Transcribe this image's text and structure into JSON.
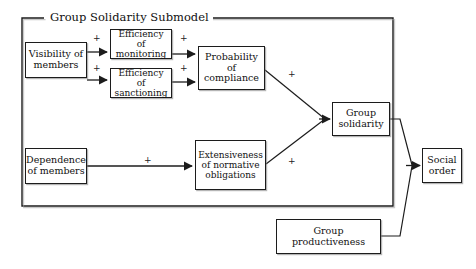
{
  "diagram": {
    "title": "Group Solidarity Submodel",
    "type": "causal-path-diagram",
    "frame": {
      "label": "Group Solidarity Submodel",
      "x": 22,
      "y": 18,
      "width": 371,
      "height": 188
    },
    "nodes": [
      {
        "id": "visibility",
        "label": "Visibility of\nmembers",
        "x": 25,
        "y": 42,
        "width": 62,
        "height": 36,
        "font_size": 9.5
      },
      {
        "id": "efficiency-monitoring",
        "label": "Efficiency of\nmonitoring",
        "x": 110,
        "y": 29,
        "width": 62,
        "height": 30,
        "font_size": 9
      },
      {
        "id": "efficiency-sanctioning",
        "label": "Efficiency of\nsanctioning",
        "x": 110,
        "y": 68,
        "width": 62,
        "height": 30,
        "font_size": 9
      },
      {
        "id": "probability-compliance",
        "label": "Probability of\ncompliance",
        "x": 198,
        "y": 46,
        "width": 67,
        "height": 44,
        "font_size": 9.5
      },
      {
        "id": "dependence",
        "label": "Dependence\nof members",
        "x": 25,
        "y": 148,
        "width": 62,
        "height": 36,
        "font_size": 9.5
      },
      {
        "id": "extensiveness",
        "label": "Extensiveness\nof normative\nobligations",
        "x": 195,
        "y": 140,
        "width": 71,
        "height": 50,
        "font_size": 9
      },
      {
        "id": "group-solidarity",
        "label": "Group\nsolidarity",
        "x": 332,
        "y": 102,
        "width": 58,
        "height": 34,
        "font_size": 9.5
      },
      {
        "id": "group-productiveness",
        "label": "Group\nproductiveness",
        "x": 276,
        "y": 219,
        "width": 105,
        "height": 35,
        "font_size": 9.5
      },
      {
        "id": "social-order",
        "label": "Social\norder",
        "x": 422,
        "y": 148,
        "width": 40,
        "height": 35,
        "font_size": 9.5
      }
    ],
    "signs": [
      {
        "id": "sign-vis-mon",
        "label": "+",
        "x": 93,
        "y": 34
      },
      {
        "id": "sign-vis-san",
        "label": "+",
        "x": 93,
        "y": 64
      },
      {
        "id": "sign-mon-prob",
        "label": "+",
        "x": 180,
        "y": 34
      },
      {
        "id": "sign-san-prob",
        "label": "+",
        "x": 180,
        "y": 64
      },
      {
        "id": "sign-prob-sol",
        "label": "+",
        "x": 288,
        "y": 70
      },
      {
        "id": "sign-dep-ext",
        "label": "+",
        "x": 144,
        "y": 156
      },
      {
        "id": "sign-ext-sol",
        "label": "+",
        "x": 288,
        "y": 157
      }
    ],
    "edges": [
      {
        "id": "visibility-to-efficiency-monitoring",
        "from": "visibility",
        "to": "efficiency-monitoring",
        "sign": "+"
      },
      {
        "id": "visibility-to-efficiency-sanctioning",
        "from": "visibility",
        "to": "efficiency-sanctioning",
        "sign": "+"
      },
      {
        "id": "monitoring-to-probability",
        "from": "efficiency-monitoring",
        "to": "probability-compliance",
        "sign": "+"
      },
      {
        "id": "sanctioning-to-probability",
        "from": "efficiency-sanctioning",
        "to": "probability-compliance",
        "sign": "+"
      },
      {
        "id": "probability-to-solidarity",
        "from": "probability-compliance",
        "to": "group-solidarity",
        "sign": "+"
      },
      {
        "id": "dependence-to-extensiveness",
        "from": "dependence",
        "to": "extensiveness",
        "sign": "+"
      },
      {
        "id": "extensiveness-to-solidarity",
        "from": "extensiveness",
        "to": "group-solidarity",
        "sign": "+"
      },
      {
        "id": "solidarity-to-social-order",
        "from": "group-solidarity",
        "to": "social-order",
        "sign": ""
      },
      {
        "id": "productiveness-to-social-order",
        "from": "group-productiveness",
        "to": "social-order",
        "sign": ""
      }
    ],
    "colors": {
      "stroke": "#1c1c1c",
      "text": "#111111",
      "background": "#ffffff",
      "shadow": "#787878"
    }
  }
}
